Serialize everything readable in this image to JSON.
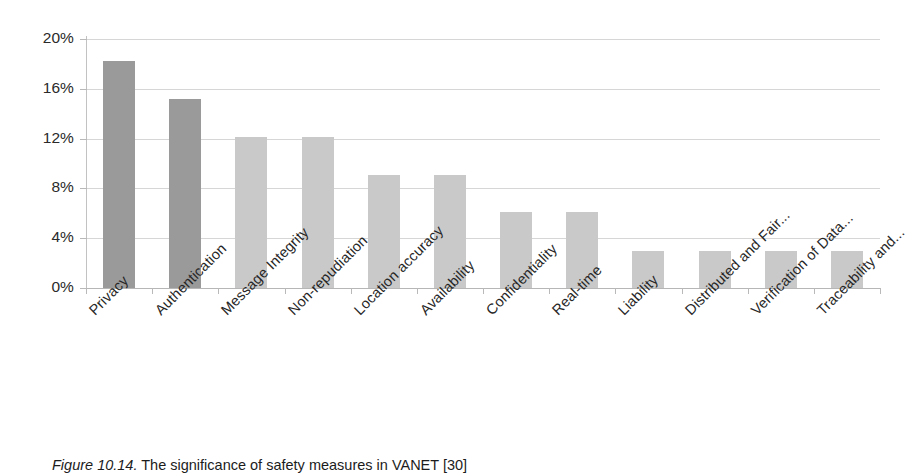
{
  "figure": {
    "caption_prefix": "Figure 10.14.",
    "caption_text": "The significance of safety measures in VANET [30]"
  },
  "chart_data": {
    "type": "bar",
    "title": "",
    "xlabel": "",
    "ylabel": "",
    "ylim": [
      0,
      20
    ],
    "ytick_labels": [
      "20%",
      "16%",
      "12%",
      "8%",
      "4%",
      "0%"
    ],
    "ytick_values": [
      20,
      16,
      12,
      8,
      4,
      0
    ],
    "grid": true,
    "legend": "none",
    "categories": [
      "Privacy",
      "Authentication",
      "Message Integrity",
      "Non-repudiation",
      "Location accuracy",
      "Availability",
      "Confidentiality",
      "Real-time",
      "Liability",
      "Distributed and Fair...",
      "Verification of Data...",
      "Traceability and..."
    ],
    "values": [
      18.2,
      15.2,
      12.1,
      12.1,
      9.1,
      9.1,
      6.1,
      6.1,
      3.0,
      3.0,
      3.0,
      3.0
    ],
    "value_unit": "%",
    "bar_colors": [
      "#9a9a9a",
      "#9a9a9a",
      "#c9c9c9",
      "#c9c9c9",
      "#c9c9c9",
      "#c9c9c9",
      "#c9c9c9",
      "#c9c9c9",
      "#c9c9c9",
      "#c9c9c9",
      "#c9c9c9",
      "#c9c9c9"
    ],
    "gridline_color": "#cfcfcf",
    "axis_color": "#b9b9b9",
    "background": "#ffffff"
  }
}
